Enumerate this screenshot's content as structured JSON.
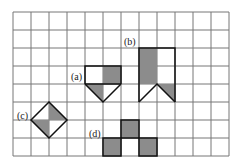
{
  "diagram": {
    "grid": {
      "cols": 12,
      "rows": 8,
      "cell": 18,
      "origin": [
        13,
        12
      ],
      "line_color": "#777777"
    },
    "shade_color": "#8c8c8c",
    "outline_color": "#111111",
    "labels": {
      "a": "(a)",
      "b": "(b)",
      "c": "(c)",
      "d": "(d)"
    }
  }
}
